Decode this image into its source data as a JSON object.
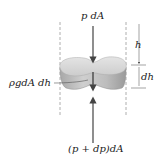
{
  "diagram": {
    "type": "fluid-element-free-body",
    "labels": {
      "top_force": "p dA",
      "bottom_force": "(p + dp)dA",
      "weight": "ρgdA dh",
      "depth": "h",
      "thickness": "dh"
    },
    "colors": {
      "background": "#ffffff",
      "element_top": "#d9d9d9",
      "element_side": "#b8b8b8",
      "arrow": "#444444",
      "dashed": "#999999",
      "text": "#1a1a1a"
    }
  }
}
